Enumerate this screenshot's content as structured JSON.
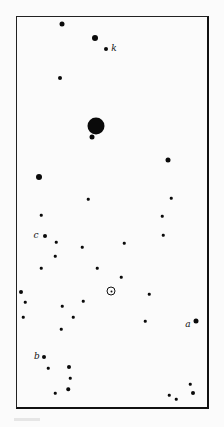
{
  "diagram": {
    "type": "star-field",
    "frame": {
      "x": 16,
      "y": 16,
      "width": 193,
      "height": 393
    },
    "sun": {
      "symbol": "sun-symbol",
      "x": 111,
      "y": 291,
      "size": 9
    },
    "labels": [
      {
        "text": "k",
        "x": 114,
        "y": 48
      },
      {
        "text": "c",
        "x": 36,
        "y": 235
      },
      {
        "text": "a",
        "x": 188,
        "y": 324
      },
      {
        "text": "b",
        "x": 37,
        "y": 356
      }
    ],
    "stars": [
      {
        "x": 62,
        "y": 24,
        "size": 5
      },
      {
        "x": 95,
        "y": 38,
        "size": 6
      },
      {
        "x": 106,
        "y": 49,
        "size": 4
      },
      {
        "x": 60,
        "y": 78,
        "size": 4
      },
      {
        "x": 96,
        "y": 126,
        "size": 17
      },
      {
        "x": 92,
        "y": 137,
        "size": 5
      },
      {
        "x": 39,
        "y": 177,
        "size": 6
      },
      {
        "x": 168,
        "y": 160,
        "size": 5
      },
      {
        "x": 88,
        "y": 199,
        "size": 2.5
      },
      {
        "x": 171,
        "y": 198,
        "size": 2.5
      },
      {
        "x": 41,
        "y": 215,
        "size": 2.5
      },
      {
        "x": 162,
        "y": 216,
        "size": 2.5
      },
      {
        "x": 45,
        "y": 236,
        "size": 4
      },
      {
        "x": 163,
        "y": 235,
        "size": 2.5
      },
      {
        "x": 56,
        "y": 242,
        "size": 2.5
      },
      {
        "x": 82,
        "y": 247,
        "size": 2.5
      },
      {
        "x": 124,
        "y": 243,
        "size": 2.5
      },
      {
        "x": 55,
        "y": 256,
        "size": 2.5
      },
      {
        "x": 41,
        "y": 268,
        "size": 2.5
      },
      {
        "x": 97,
        "y": 268,
        "size": 2.5
      },
      {
        "x": 121,
        "y": 277,
        "size": 2.5
      },
      {
        "x": 21,
        "y": 292,
        "size": 4
      },
      {
        "x": 149,
        "y": 294,
        "size": 2.5
      },
      {
        "x": 25,
        "y": 302,
        "size": 2.5
      },
      {
        "x": 83,
        "y": 301,
        "size": 2.5
      },
      {
        "x": 62,
        "y": 306,
        "size": 2.5
      },
      {
        "x": 23,
        "y": 317,
        "size": 2.5
      },
      {
        "x": 73,
        "y": 317,
        "size": 2.5
      },
      {
        "x": 145,
        "y": 321,
        "size": 2.5
      },
      {
        "x": 196,
        "y": 321,
        "size": 5
      },
      {
        "x": 61,
        "y": 329,
        "size": 2.5
      },
      {
        "x": 44,
        "y": 357,
        "size": 4
      },
      {
        "x": 48,
        "y": 368,
        "size": 2.5
      },
      {
        "x": 69,
        "y": 367,
        "size": 4
      },
      {
        "x": 70,
        "y": 378,
        "size": 2.5
      },
      {
        "x": 68,
        "y": 389,
        "size": 3.5
      },
      {
        "x": 55,
        "y": 393,
        "size": 2.5
      },
      {
        "x": 190,
        "y": 384,
        "size": 2.5
      },
      {
        "x": 193,
        "y": 393,
        "size": 4
      },
      {
        "x": 169,
        "y": 395,
        "size": 2.5
      },
      {
        "x": 176,
        "y": 399,
        "size": 2.5
      }
    ]
  }
}
